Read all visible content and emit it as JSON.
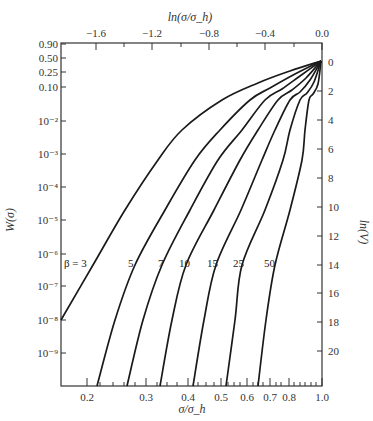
{
  "chart_data": {
    "type": "line",
    "title": "",
    "xlabel": "σ/σ_h",
    "x_top_label": "ln(σ/σ_h)",
    "ylabel": "W(σ)",
    "y_right_label": "ln(V)",
    "x_scale": "log",
    "xlim": [
      0.167,
      1.0
    ],
    "x_ticks": [
      0.2,
      0.3,
      0.4,
      0.5,
      0.6,
      0.7,
      0.8,
      1.0
    ],
    "x_tick_labels": [
      "0.2",
      "0.3",
      "0.4",
      "0.5",
      "0.6",
      "0.7",
      "0.8",
      "1.0"
    ],
    "x_top_ticks": [
      -1.6,
      -1.2,
      -0.8,
      -0.4,
      0.0
    ],
    "x_top_tick_labels": [
      "−1.6",
      "−1.2",
      "−0.8",
      "−0.4",
      "0.0"
    ],
    "y_scale": "weibull (ln(-ln(1-W)))",
    "y_tick_labels": [
      "0.90",
      "0.50",
      "0.25",
      "0.10",
      "10⁻²",
      "10⁻³",
      "10⁻⁴",
      "10⁻⁵",
      "10⁻⁶",
      "10⁻⁷",
      "10⁻⁸",
      "10⁻⁹"
    ],
    "y_right_ticks": [
      0,
      2,
      4,
      6,
      8,
      10,
      12,
      14,
      16,
      18,
      20
    ],
    "y_right_tick_labels": [
      "0",
      "2",
      "4",
      "6",
      "8",
      "10",
      "12",
      "14",
      "16",
      "18",
      "20"
    ],
    "grid": false,
    "legend": "inline curve labels",
    "series": [
      {
        "name": "β = 3",
        "label": "β = 3",
        "x": [
          1.0,
          0.78,
          0.6,
          0.45,
          0.17
        ],
        "lnV": [
          0,
          2.6,
          4.7,
          6.8,
          17.9
        ]
      },
      {
        "name": "β = 5",
        "label": "5",
        "x": [
          1.0,
          0.95,
          0.76,
          0.57,
          0.4,
          0.21
        ],
        "lnV": [
          0,
          1.6,
          4.8,
          6.8,
          10.0,
          22.3
        ]
      },
      {
        "name": "β = 7",
        "label": "7",
        "x": [
          1.0,
          0.95,
          0.84,
          0.67,
          0.45,
          0.26
        ],
        "lnV": [
          0,
          1.6,
          4.8,
          6.8,
          10.0,
          22.3
        ]
      },
      {
        "name": "β = 10",
        "label": "10",
        "x": [
          1.0,
          0.95,
          0.88,
          0.78,
          0.53,
          0.33
        ],
        "lnV": [
          0,
          1.6,
          4.8,
          6.8,
          12.0,
          22.3
        ]
      },
      {
        "name": "β = 15",
        "label": "15",
        "x": [
          1.0,
          0.96,
          0.92,
          0.87,
          0.65,
          0.42
        ],
        "lnV": [
          0,
          1.6,
          4.8,
          6.8,
          12.0,
          22.3
        ]
      },
      {
        "name": "β = 25",
        "label": "25",
        "x": [
          1.0,
          0.97,
          0.96,
          0.9,
          0.78,
          0.52
        ],
        "lnV": [
          0,
          1.6,
          4.8,
          6.8,
          12.0,
          22.3
        ]
      },
      {
        "name": "β = 50",
        "label": "50",
        "x": [
          1.0,
          0.98,
          0.94,
          0.88,
          0.67
        ],
        "lnV": [
          0,
          4.8,
          6.8,
          14.0,
          22.3
        ]
      }
    ],
    "render": {
      "plot_box": {
        "left": 61,
        "top": 43,
        "right": 322,
        "bottom": 386
      },
      "x_bottom_ticks_px": [
        87,
        146,
        188,
        221,
        247,
        270,
        289,
        322
      ],
      "x_bottom_minor_px": [
        100,
        113,
        124,
        135,
        157,
        167,
        177,
        198,
        206,
        214,
        228,
        234,
        240,
        253,
        258,
        263,
        276,
        281,
        294,
        300,
        305,
        311,
        316
      ],
      "x_top_ticks_px": [
        96,
        152,
        209,
        265,
        322
      ],
      "x_top_minor_px": [
        124,
        181,
        237,
        294
      ],
      "y_left_ticks_px": [
        44,
        58,
        72,
        87,
        121,
        154,
        187,
        220,
        254,
        286,
        320,
        353
      ],
      "y_right_ticks_px": [
        62,
        91,
        120,
        149,
        178,
        207,
        236,
        265,
        293,
        322,
        351
      ],
      "curves_px": [
        [
          [
            321,
            61
          ],
          [
            290,
            71
          ],
          [
            258,
            83
          ],
          [
            222,
            100
          ],
          [
            182,
            130
          ],
          [
            158,
            160
          ],
          [
            125,
            210
          ],
          [
            93,
            265
          ],
          [
            61,
            320
          ]
        ],
        [
          [
            321,
            61
          ],
          [
            295,
            74
          ],
          [
            270,
            88
          ],
          [
            250,
            100
          ],
          [
            220,
            130
          ],
          [
            195,
            160
          ],
          [
            165,
            210
          ],
          [
            135,
            265
          ],
          [
            115,
            320
          ],
          [
            97,
            386
          ]
        ],
        [
          [
            321,
            61
          ],
          [
            300,
            76
          ],
          [
            282,
            89
          ],
          [
            265,
            100
          ],
          [
            242,
            130
          ],
          [
            218,
            160
          ],
          [
            190,
            210
          ],
          [
            162,
            265
          ],
          [
            143,
            320
          ],
          [
            127,
            386
          ]
        ],
        [
          [
            321,
            61
          ],
          [
            306,
            78
          ],
          [
            292,
            90
          ],
          [
            278,
            100
          ],
          [
            258,
            130
          ],
          [
            240,
            160
          ],
          [
            214,
            210
          ],
          [
            186,
            265
          ],
          [
            172,
            320
          ],
          [
            160,
            386
          ]
        ],
        [
          [
            321,
            61
          ],
          [
            310,
            80
          ],
          [
            300,
            92
          ],
          [
            290,
            100
          ],
          [
            275,
            130
          ],
          [
            262,
            160
          ],
          [
            241,
            210
          ],
          [
            216,
            265
          ],
          [
            204,
            320
          ],
          [
            193,
            386
          ]
        ],
        [
          [
            321,
            61
          ],
          [
            314,
            82
          ],
          [
            307,
            93
          ],
          [
            300,
            100
          ],
          [
            290,
            130
          ],
          [
            283,
            160
          ],
          [
            265,
            210
          ],
          [
            242,
            265
          ],
          [
            235,
            320
          ],
          [
            226,
            386
          ]
        ],
        [
          [
            321,
            61
          ],
          [
            318,
            84
          ],
          [
            313,
            94
          ],
          [
            309,
            100
          ],
          [
            305,
            130
          ],
          [
            302,
            160
          ],
          [
            290,
            210
          ],
          [
            275,
            265
          ],
          [
            266,
            320
          ],
          [
            258,
            386
          ]
        ]
      ],
      "curve_labels_px": [
        [
          64,
          267
        ],
        [
          128,
          267
        ],
        [
          158,
          267
        ],
        [
          179,
          267
        ],
        [
          207,
          267
        ],
        [
          233,
          267
        ],
        [
          264,
          267
        ]
      ],
      "stroke_color": "#1a1a1a"
    }
  }
}
